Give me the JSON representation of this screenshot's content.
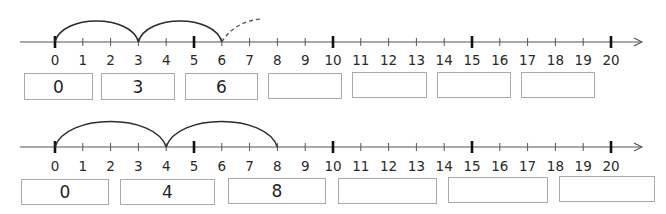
{
  "number_lines": [
    {
      "id": "line-1",
      "min": 0,
      "max": 20,
      "tick_labels": [
        "0",
        "1",
        "2",
        "3",
        "4",
        "5",
        "6",
        "7",
        "8",
        "9",
        "10",
        "11",
        "12",
        "13",
        "14",
        "15",
        "16",
        "17",
        "18",
        "19",
        "20"
      ],
      "major_ticks": [
        0,
        5,
        10,
        15,
        20
      ],
      "jumps": [
        {
          "from": 0,
          "to": 3,
          "style": "solid"
        },
        {
          "from": 3,
          "to": 6,
          "style": "solid"
        },
        {
          "from": 6,
          "to": 7.5,
          "style": "dashed"
        }
      ],
      "step": 3,
      "answer_boxes": [
        {
          "value": "0"
        },
        {
          "value": "3"
        },
        {
          "value": "6"
        },
        {
          "value": ""
        },
        {
          "value": ""
        },
        {
          "value": ""
        },
        {
          "value": ""
        }
      ]
    },
    {
      "id": "line-2",
      "min": 0,
      "max": 20,
      "tick_labels": [
        "0",
        "1",
        "2",
        "3",
        "4",
        "5",
        "6",
        "7",
        "8",
        "9",
        "10",
        "11",
        "12",
        "13",
        "14",
        "15",
        "16",
        "17",
        "18",
        "19",
        "20"
      ],
      "major_ticks": [
        0,
        5,
        10,
        15,
        20
      ],
      "jumps": [
        {
          "from": 0,
          "to": 4,
          "style": "solid"
        },
        {
          "from": 4,
          "to": 8,
          "style": "solid"
        }
      ],
      "step": 4,
      "answer_boxes": [
        {
          "value": "0"
        },
        {
          "value": "4"
        },
        {
          "value": "8"
        },
        {
          "value": ""
        },
        {
          "value": ""
        },
        {
          "value": ""
        }
      ]
    }
  ],
  "colors": {
    "line": "#444444",
    "arc": "#2b2b2b",
    "box_border": "#a9a9a9",
    "text": "#222222"
  }
}
